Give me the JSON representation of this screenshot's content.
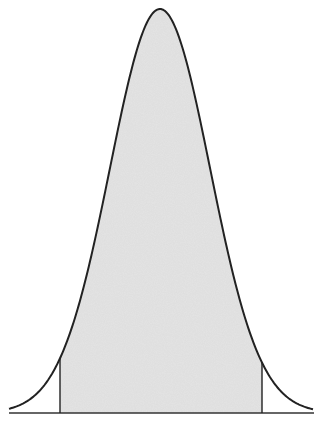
{
  "chart_data": {
    "type": "area",
    "title": "",
    "subtitle": "",
    "xlabel": "",
    "ylabel": "",
    "description": "Normal distribution curve with shaded central region between two vertical cutoff lines",
    "distribution": "normal",
    "mean": 0,
    "sd": 1,
    "x_range": [
      -3.02,
      3.06
    ],
    "shaded_region": {
      "from": -2.0,
      "to": 2.04
    },
    "grid": false,
    "legend": null,
    "tick_labels": [],
    "annotations": []
  },
  "style": {
    "fill_color": "#e4e4e4",
    "line_color": "#222222",
    "axis_color": "#333333",
    "background": "#ffffff"
  },
  "layout": {
    "width": 330,
    "height": 425,
    "center_px": 160,
    "sd_px": 50,
    "baseline_y": 413,
    "peak_y": 9,
    "axis_x_start": 9,
    "axis_x_end": 314,
    "curve_x_start": 9,
    "curve_x_end": 313
  }
}
